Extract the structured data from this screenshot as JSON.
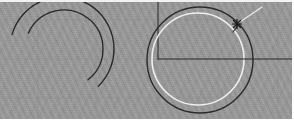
{
  "app": {
    "window_title": "CAD Drawing Canvas",
    "canvas_label": "drawing-viewport"
  },
  "canvas": {
    "width": 294,
    "height": 132,
    "viewport_top": 2,
    "viewport_height": 117,
    "background_color": "#9a9a9a",
    "surround_color": "#ffffff",
    "texture": "diagonal-hatch-noise"
  },
  "grid": {
    "visible": true,
    "color": "#8d8d8d",
    "line_width": 1,
    "vertical_x": [
      38,
      96,
      158,
      218,
      278
    ],
    "horizontal_y": [
      18,
      57,
      96
    ]
  },
  "entities": [
    {
      "id": "arc-outer",
      "name": "arc-outer",
      "type": "arc",
      "stroke": "#262626",
      "stroke_width": 1.3,
      "center_x": 62,
      "center_y": 47,
      "radius": 52,
      "start_angle_deg": 196,
      "end_angle_deg": 46
    },
    {
      "id": "arc-inner",
      "name": "arc-inner",
      "type": "arc",
      "stroke": "#262626",
      "stroke_width": 1.3,
      "center_x": 64,
      "center_y": 47,
      "radius": 39,
      "start_angle_deg": 204,
      "end_angle_deg": 52
    },
    {
      "id": "circle-outer",
      "name": "circle-outer",
      "type": "circle",
      "stroke": "#2b2b2b",
      "stroke_width": 1.4,
      "center_x": 200,
      "center_y": 58,
      "radius": 53
    },
    {
      "id": "circle-inner-highlight",
      "name": "circle-inner-highlight",
      "type": "circle",
      "stroke": "#efefef",
      "stroke_width": 1.6,
      "center_x": 198,
      "center_y": 57,
      "radius": 46
    },
    {
      "id": "radius-line",
      "name": "radius-construction-line",
      "type": "line",
      "stroke": "#2b2b2b",
      "stroke_width": 1.2,
      "x1": 158,
      "y1": 57,
      "x2": 294,
      "y2": 57
    },
    {
      "id": "vertical-tick",
      "name": "vertical-construction-line",
      "type": "line",
      "stroke": "#2b2b2b",
      "stroke_width": 1.0,
      "x1": 158,
      "y1": 57,
      "x2": 158,
      "y2": 0
    },
    {
      "id": "leader-line",
      "name": "leader-line",
      "type": "line",
      "stroke": "#e8e8e8",
      "stroke_width": 1.3,
      "x1": 237,
      "y1": 22,
      "x2": 262,
      "y2": 5
    },
    {
      "id": "snap-marker",
      "name": "snap-point-marker",
      "type": "marker",
      "stroke": "#1a1a1a",
      "stroke_width": 1.2,
      "x": 237,
      "y": 22,
      "size": 7,
      "shape": "cross-star"
    },
    {
      "id": "tangent-stub",
      "name": "tangent-stub-line",
      "type": "line",
      "stroke": "#2b2b2b",
      "stroke_width": 1.2,
      "x1": 233,
      "y1": 30,
      "x2": 242,
      "y2": 18
    }
  ],
  "toolbar": {
    "present": false
  }
}
